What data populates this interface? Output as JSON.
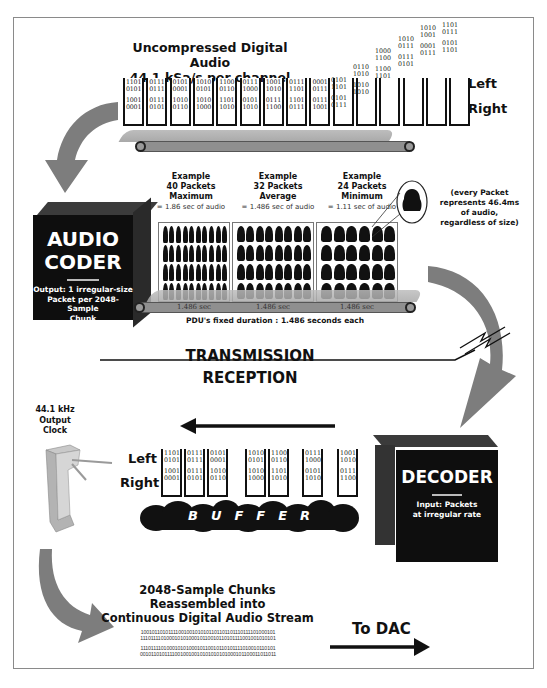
{
  "top": {
    "title_line1": "Uncompressed Digital Audio",
    "title_line2": "44.1 kSa/s per channel",
    "left_label": "Left",
    "right_label": "Right",
    "bins": [
      {
        "left": [
          "1101",
          "0101"
        ],
        "right": [
          "1001",
          "0001"
        ]
      },
      {
        "left": [
          "0111",
          "0111"
        ],
        "right": [
          "0111",
          "0101"
        ]
      },
      {
        "left": [
          "0101",
          "0001"
        ],
        "right": [
          "1010",
          "0110"
        ]
      },
      {
        "left": [
          "1010",
          "0101"
        ],
        "right": [
          "1010",
          "1000"
        ]
      },
      {
        "left": [
          "1100",
          "0110"
        ],
        "right": [
          "1101",
          "1010"
        ]
      },
      {
        "left": [
          "0111",
          "1000"
        ],
        "right": [
          "0101",
          "1010"
        ]
      },
      {
        "left": [
          "1001",
          "1010"
        ],
        "right": [
          "0111",
          "1100"
        ]
      },
      {
        "left": [
          "0111",
          "1101"
        ],
        "right": [
          "1101",
          "0111"
        ]
      },
      {
        "left": [
          "0001",
          "0111"
        ],
        "right": [
          "0111",
          "1001"
        ]
      }
    ],
    "rising_bits": [
      {
        "left": [
          "0101",
          "1101"
        ],
        "right": [
          "0101",
          "0111"
        ]
      },
      {
        "left": [
          "0110",
          "1010"
        ],
        "right": [
          "1010",
          "1010"
        ]
      },
      {
        "left": [
          "1000",
          "1100"
        ],
        "right": [
          "1100",
          "1101"
        ]
      },
      {
        "left": [
          "1010",
          "0111"
        ],
        "right": [
          "0111",
          "0101"
        ]
      },
      {
        "left": [
          "1010",
          "1001"
        ],
        "right": [
          "0001",
          "0111"
        ]
      },
      {
        "left": [
          "1101",
          "0111"
        ],
        "right": [
          "0101",
          "1101"
        ]
      }
    ]
  },
  "coder": {
    "title_line1": "AUDIO",
    "title_line2": "CODER",
    "subtitle_line1": "Output: 1 irregular-size",
    "subtitle_line2": "Packet per 2048-Sample",
    "subtitle_line3": "Chunk"
  },
  "examples": [
    {
      "line1": "Example",
      "line2": "40 Packets",
      "line3": "Maximum",
      "note": "= 1.86 sec of audio",
      "packets": 40,
      "cols": 10,
      "belt": "1.486 sec"
    },
    {
      "line1": "Example",
      "line2": "32 Packets",
      "line3": "Average",
      "note": "= 1.486 sec of audio",
      "packets": 32,
      "cols": 8,
      "belt": "1.486 sec"
    },
    {
      "line1": "Example",
      "line2": "24 Packets",
      "line3": "Minimum",
      "note": "= 1.11 sec of audio",
      "packets": 24,
      "cols": 6,
      "belt": "1.486 sec"
    }
  ],
  "packet_note": {
    "line1": "(every Packet",
    "line2": "represents 46.4ms",
    "line3": "of audio,",
    "line4": "regardless of size)"
  },
  "pdu_caption": "PDU's fixed duration :  1.486 seconds each",
  "transmission_label": "TRANSMISSION",
  "reception_label": "RECEPTION",
  "clock": {
    "line1": "44.1 kHz",
    "line2": "Output",
    "line3": "Clock"
  },
  "bottom": {
    "left_label": "Left",
    "right_label": "Right",
    "bins": [
      {
        "left": [
          "1101",
          "0101"
        ],
        "right": [
          "1001",
          "0001"
        ]
      },
      {
        "left": [
          "0111",
          "0111"
        ],
        "right": [
          "0111",
          "0101"
        ]
      },
      {
        "left": [
          "0101",
          "0001"
        ],
        "right": [
          "1010",
          "0110"
        ]
      },
      {
        "left": [
          "1010",
          "0101"
        ],
        "right": [
          "1010",
          "1000"
        ]
      },
      {
        "left": [
          "1100",
          "0110"
        ],
        "right": [
          "1101",
          "1010"
        ]
      },
      {
        "left": [
          "0111",
          "1000"
        ],
        "right": [
          "0101",
          "1010"
        ]
      },
      {
        "left": [
          "1001",
          "1010"
        ],
        "right": [
          "0111",
          "1100"
        ]
      }
    ],
    "buffer_label": "BUFFER"
  },
  "decoder": {
    "title": "DECODER",
    "subtitle_line1": "Input: Packets",
    "subtitle_line2": "at irregular rate"
  },
  "reassembly": {
    "line1": "2048-Sample Chunks",
    "line2": "Reassembled into",
    "line3": "Continuous Digital Audio Stream",
    "stream": [
      "10010110101111001001010101101101101110111101000101",
      "11101111010001010100010110010110101111001001010101",
      "11101111010001010100010110010110101111010010110101",
      "00101101011110010010010101010101000101100011011011"
    ]
  },
  "dac_label": "To DAC",
  "colors": {
    "arrow_gray": "#7d7d7d",
    "box_black": "#0e0e0e",
    "belt_gray": "#a8a8a8"
  }
}
